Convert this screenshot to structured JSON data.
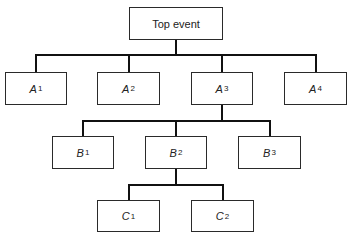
{
  "diagram": {
    "type": "fault-tree",
    "nodes": {
      "top": {
        "label": "Top event"
      },
      "a1": {
        "label": "A",
        "sub": "1"
      },
      "a2": {
        "label": "A",
        "sub": "2"
      },
      "a3": {
        "label": "A",
        "sub": "3"
      },
      "a4": {
        "label": "A",
        "sub": "4"
      },
      "b1": {
        "label": "B",
        "sub": "1"
      },
      "b2": {
        "label": "B",
        "sub": "2"
      },
      "b3": {
        "label": "B",
        "sub": "3"
      },
      "c1": {
        "label": "C",
        "sub": "1"
      },
      "c2": {
        "label": "C",
        "sub": "2"
      }
    },
    "edges": [
      [
        "Top event",
        "A1"
      ],
      [
        "Top event",
        "A2"
      ],
      [
        "Top event",
        "A3"
      ],
      [
        "Top event",
        "A4"
      ],
      [
        "A3",
        "B1"
      ],
      [
        "A3",
        "B2"
      ],
      [
        "A3",
        "B3"
      ],
      [
        "B2",
        "C1"
      ],
      [
        "B2",
        "C2"
      ]
    ]
  }
}
